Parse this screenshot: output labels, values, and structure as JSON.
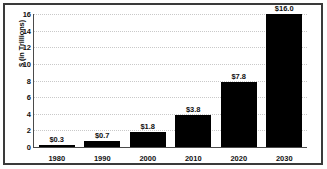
{
  "chart_data": {
    "type": "bar",
    "title": "",
    "subtitle": "",
    "xlabel": "",
    "ylabel": "$ (in Trillions)",
    "categories": [
      "1980",
      "1990",
      "2000",
      "2010",
      "2020",
      "2030"
    ],
    "values": [
      0.3,
      0.7,
      1.8,
      3.8,
      7.8,
      16.0
    ],
    "point_labels": [
      "$0.3",
      "$0.7",
      "$1.8",
      "$3.8",
      "$7.8",
      "$16.0"
    ],
    "ylim": [
      0,
      16
    ],
    "yticks": [
      0,
      2,
      4,
      6,
      8,
      10,
      12,
      14,
      16
    ],
    "ytick_labels": [
      "0",
      "2",
      "4",
      "6",
      "8",
      "10",
      "12",
      "14",
      "16"
    ],
    "grid": true,
    "grid_axis": "y",
    "legend": false,
    "legend_position": "none",
    "bar_color": "#000000",
    "grid_color": "#c9c9c9",
    "axis_color": "#4a4a4a",
    "frame_color": "#3a3a3a",
    "background": "#ffffff"
  }
}
